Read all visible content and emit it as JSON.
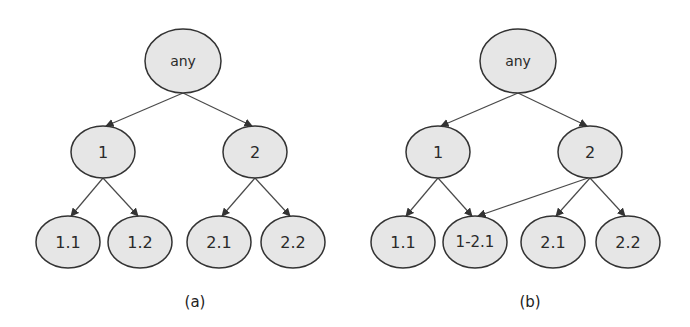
{
  "colors": {
    "node_fill": "#e6e6e6",
    "node_stroke": "#333333",
    "edge": "#4a4a4a",
    "text": "#2a2a2a",
    "background": "#ffffff"
  },
  "diagrams": [
    {
      "id": "a",
      "caption": "(a)",
      "caption_pos": {
        "x": 195,
        "y": 302
      },
      "nodes": [
        {
          "id": "any",
          "label": "any",
          "cx": 183,
          "cy": 61,
          "rx": 38,
          "ry": 32,
          "font_size": 14
        },
        {
          "id": "1",
          "label": "1",
          "cx": 103,
          "cy": 152,
          "rx": 32,
          "ry": 26,
          "font_size": 16
        },
        {
          "id": "2",
          "label": "2",
          "cx": 255,
          "cy": 152,
          "rx": 32,
          "ry": 26,
          "font_size": 16
        },
        {
          "id": "1.1",
          "label": "1.1",
          "cx": 68,
          "cy": 242,
          "rx": 32,
          "ry": 26,
          "font_size": 16
        },
        {
          "id": "1.2",
          "label": "1.2",
          "cx": 140,
          "cy": 242,
          "rx": 32,
          "ry": 26,
          "font_size": 16
        },
        {
          "id": "2.1",
          "label": "2.1",
          "cx": 219,
          "cy": 242,
          "rx": 32,
          "ry": 26,
          "font_size": 16
        },
        {
          "id": "2.2",
          "label": "2.2",
          "cx": 293,
          "cy": 242,
          "rx": 32,
          "ry": 26,
          "font_size": 16
        }
      ],
      "edges": [
        {
          "from": "any",
          "to": "1",
          "x1": 183,
          "y1": 93,
          "x2": 106,
          "y2": 126
        },
        {
          "from": "any",
          "to": "2",
          "x1": 183,
          "y1": 93,
          "x2": 252,
          "y2": 126
        },
        {
          "from": "1",
          "to": "1.1",
          "x1": 103,
          "y1": 178,
          "x2": 71,
          "y2": 216
        },
        {
          "from": "1",
          "to": "1.2",
          "x1": 103,
          "y1": 178,
          "x2": 138,
          "y2": 216
        },
        {
          "from": "2",
          "to": "2.1",
          "x1": 255,
          "y1": 178,
          "x2": 222,
          "y2": 216
        },
        {
          "from": "2",
          "to": "2.2",
          "x1": 255,
          "y1": 178,
          "x2": 290,
          "y2": 216
        }
      ]
    },
    {
      "id": "b",
      "caption": "(b)",
      "caption_pos": {
        "x": 530,
        "y": 302
      },
      "nodes": [
        {
          "id": "any",
          "label": "any",
          "cx": 518,
          "cy": 61,
          "rx": 38,
          "ry": 32,
          "font_size": 14
        },
        {
          "id": "1",
          "label": "1",
          "cx": 438,
          "cy": 152,
          "rx": 32,
          "ry": 26,
          "font_size": 16
        },
        {
          "id": "2",
          "label": "2",
          "cx": 590,
          "cy": 152,
          "rx": 32,
          "ry": 26,
          "font_size": 16
        },
        {
          "id": "1.1",
          "label": "1.1",
          "cx": 403,
          "cy": 242,
          "rx": 32,
          "ry": 26,
          "font_size": 16
        },
        {
          "id": "1-2.1",
          "label": "1-2.1",
          "cx": 475,
          "cy": 242,
          "rx": 32,
          "ry": 26,
          "font_size": 15
        },
        {
          "id": "2.1",
          "label": "2.1",
          "cx": 553,
          "cy": 242,
          "rx": 32,
          "ry": 26,
          "font_size": 16
        },
        {
          "id": "2.2",
          "label": "2.2",
          "cx": 628,
          "cy": 242,
          "rx": 32,
          "ry": 26,
          "font_size": 16
        }
      ],
      "edges": [
        {
          "from": "any",
          "to": "1",
          "x1": 518,
          "y1": 93,
          "x2": 441,
          "y2": 126
        },
        {
          "from": "any",
          "to": "2",
          "x1": 518,
          "y1": 93,
          "x2": 587,
          "y2": 126
        },
        {
          "from": "1",
          "to": "1.1",
          "x1": 438,
          "y1": 178,
          "x2": 406,
          "y2": 216
        },
        {
          "from": "1",
          "to": "1-2.1",
          "x1": 438,
          "y1": 178,
          "x2": 472,
          "y2": 216
        },
        {
          "from": "2",
          "to": "1-2.1",
          "x1": 588,
          "y1": 178,
          "x2": 478,
          "y2": 216
        },
        {
          "from": "2",
          "to": "2.1",
          "x1": 590,
          "y1": 178,
          "x2": 556,
          "y2": 216
        },
        {
          "from": "2",
          "to": "2.2",
          "x1": 590,
          "y1": 178,
          "x2": 625,
          "y2": 216
        }
      ]
    }
  ]
}
